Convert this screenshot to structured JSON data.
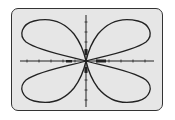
{
  "calculator_screen": {
    "background_color": "#e6e6e6",
    "curve_color": "#222222",
    "graph": {
      "type": "polar-rose",
      "petals": 4,
      "petal_directions": [
        "upper-left",
        "upper-right",
        "lower-left",
        "lower-right"
      ],
      "axes": {
        "x_ticks": 10,
        "y_ticks": 8
      }
    }
  }
}
